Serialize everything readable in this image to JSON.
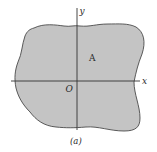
{
  "figure": {
    "caption": "(a)",
    "region_label": "A",
    "origin_label": "O",
    "x_axis_label": "x",
    "y_axis_label": "y"
  },
  "colors": {
    "region_fill": "#c4c4c4",
    "region_stroke": "#4a4a4a",
    "axis": "#333333",
    "text": "#2a2a2a",
    "background": "#ffffff"
  }
}
